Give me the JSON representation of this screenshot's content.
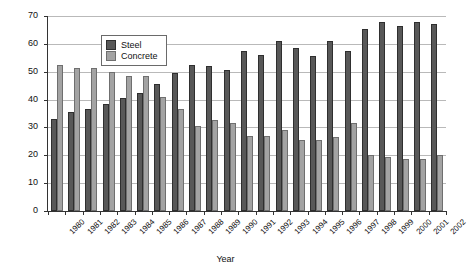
{
  "chart_data": {
    "type": "bar",
    "title": "",
    "xlabel": "Year",
    "ylabel": "% by floor area",
    "ylim": [
      0,
      70
    ],
    "ytick_step": 10,
    "yticks": [
      0,
      10,
      20,
      30,
      40,
      50,
      60,
      70
    ],
    "grid": true,
    "legend_position": "top-left",
    "categories": [
      "1980",
      "1981",
      "1982",
      "1983",
      "1984",
      "1985",
      "1986",
      "1987",
      "1988",
      "1989",
      "1990",
      "1991",
      "1992",
      "1993",
      "1994",
      "1995",
      "1996",
      "1997",
      "1998",
      "1999",
      "2000",
      "2001",
      "2002"
    ],
    "series": [
      {
        "name": "Steel",
        "color": "#585858",
        "values": [
          33,
          35.5,
          36.5,
          38.5,
          40.5,
          42.5,
          45.5,
          49.5,
          52.5,
          52,
          50.5,
          57.5,
          56,
          61,
          58.5,
          55.5,
          61,
          57.5,
          65.5,
          68,
          66.5,
          68,
          67
        ]
      },
      {
        "name": "Concrete",
        "color": "#a3a3a3",
        "values": [
          52.5,
          51.5,
          51.5,
          50,
          48.5,
          48.5,
          41,
          36.5,
          30.5,
          32.5,
          31.5,
          27,
          27,
          29,
          25.5,
          25.5,
          26.5,
          31.5,
          20,
          19.5,
          18.5,
          18.5,
          20
        ]
      }
    ]
  },
  "legend": {
    "items": [
      {
        "label": "Steel",
        "swatch": "steel"
      },
      {
        "label": "Concrete",
        "swatch": "concrete"
      }
    ]
  }
}
